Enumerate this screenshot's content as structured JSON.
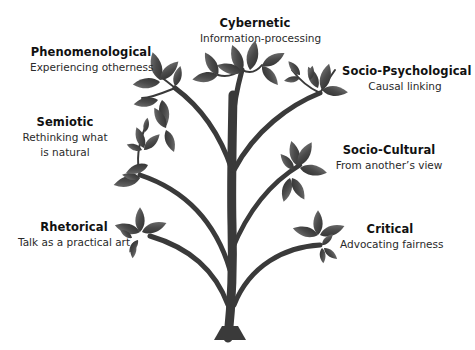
{
  "diagram": {
    "type": "tree",
    "colors": {
      "trunk": "#3a3a3a",
      "leaf": "#4a4a4a",
      "leaf_highlight": "#6e6e6e",
      "text": "#111111",
      "background": "#ffffff"
    },
    "traditions": [
      {
        "id": "cybernetic",
        "title": "Cybernetic",
        "subtitle": "Information-processing"
      },
      {
        "id": "phenomenological",
        "title": "Phenomenological",
        "subtitle": "Experiencing otherness"
      },
      {
        "id": "socio-psychological",
        "title": "Socio-Psychological",
        "subtitle": "Causal linking"
      },
      {
        "id": "semiotic",
        "title": "Semiotic",
        "subtitle_line1": "Rethinking what",
        "subtitle_line2": "is natural"
      },
      {
        "id": "socio-cultural",
        "title": "Socio-Cultural",
        "subtitle": "From another’s view"
      },
      {
        "id": "rhetorical",
        "title": "Rhetorical",
        "subtitle": "Talk as a practical art"
      },
      {
        "id": "critical",
        "title": "Critical",
        "subtitle": "Advocating fairness"
      }
    ]
  }
}
